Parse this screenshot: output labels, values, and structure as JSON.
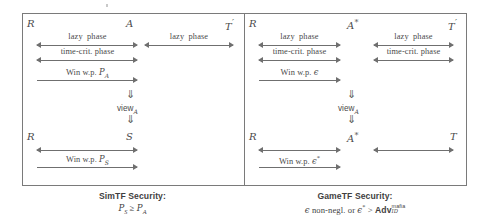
{
  "figure": {
    "type": "protocol-security-comparison-diagram",
    "panels": [
      {
        "id": "simtf",
        "parties_top": [
          {
            "name": "R",
            "symbol": "R"
          },
          {
            "name": "A",
            "symbol": "A"
          },
          {
            "name": "T-prime",
            "symbol": "T",
            "prime": "′"
          }
        ],
        "parties_bottom": [
          {
            "name": "R",
            "symbol": "R"
          },
          {
            "name": "S",
            "symbol": "S"
          }
        ],
        "interactions_left": [
          {
            "label": "lazy  phase",
            "direction": "both"
          },
          {
            "label": "time-crit.  phase",
            "direction": "both"
          },
          {
            "label": "Win w.p.",
            "var": "P",
            "sub": "A",
            "direction": "right"
          }
        ],
        "interactions_right": [
          {
            "label": "lazy  phase",
            "direction": "both"
          }
        ],
        "implication": {
          "arrow": "⇓",
          "label": "view",
          "label_sub": "A"
        },
        "bottom_interaction": {
          "label": "Win w.p.",
          "var": "P",
          "sub": "S",
          "direction": "both_then_right"
        },
        "caption_title": "SimTF Security:",
        "caption_condition_html": "P_S ≥ P_A"
      },
      {
        "id": "gametf",
        "parties_top": [
          {
            "name": "R",
            "symbol": "R"
          },
          {
            "name": "A-star",
            "symbol": "A",
            "star": "*"
          },
          {
            "name": "T-prime",
            "symbol": "T",
            "prime": "′"
          }
        ],
        "parties_bottom": [
          {
            "name": "R",
            "symbol": "R"
          },
          {
            "name": "A-star",
            "symbol": "A",
            "star": "*"
          },
          {
            "name": "T",
            "symbol": "T"
          }
        ],
        "interactions_left": [
          {
            "label": "lazy  phase",
            "direction": "both"
          },
          {
            "label": "time-crit.  phase",
            "direction": "both"
          },
          {
            "label": "Win w.p.",
            "var": "ϵ",
            "direction": "right"
          }
        ],
        "interactions_right": [
          {
            "label": "lazy  phase",
            "direction": "both"
          },
          {
            "label": "time-crit.  phase",
            "direction": "both"
          }
        ],
        "implication": {
          "arrow": "⇓",
          "label": "view",
          "label_sub": "A"
        },
        "bottom_interaction": {
          "label": "Win w.p.",
          "var": "ϵ",
          "star": "*",
          "direction": "both_then_right"
        },
        "bottom_interaction_right": {
          "label": "",
          "direction": "both"
        },
        "caption_title": "GameTF Security:",
        "caption_condition_html": "ϵ non-negl. or ϵ* > Adv_ID^mafia"
      }
    ],
    "text": {
      "lazy_phase": "lazy",
      "phase": "phase",
      "time_crit": "time-crit.",
      "win_wp": "Win w.p.",
      "view": "view",
      "double_down": "⇓",
      "sim_title": "SimTF Security:",
      "game_title": "GameTF Security:",
      "non_negl": "non-negl.",
      "or": "or",
      "gt": ">",
      "geq": "≥",
      "adv": "Adv",
      "adv_sup": "mafia",
      "adv_sub": "ID",
      "epsilon": "ϵ",
      "star": "*",
      "prime": "′",
      "P": "P",
      "sub_A": "A",
      "sub_S": "S",
      "symbol_R": "R",
      "symbol_A": "A",
      "symbol_S": "S",
      "symbol_T": "T"
    },
    "colors": {
      "ink": "#3b3b3b",
      "line": "#6f6f6f",
      "frame": "#7a7a7a",
      "background": "#ffffff"
    }
  }
}
